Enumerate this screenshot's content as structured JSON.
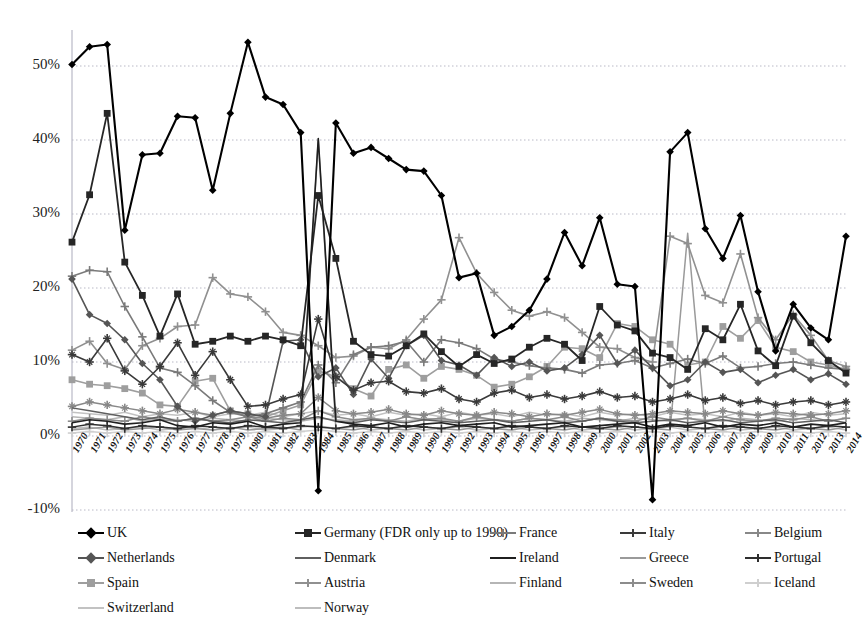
{
  "chart_data": {
    "type": "line",
    "title": "",
    "xlabel": "",
    "ylabel": "",
    "ylim": [
      -10,
      55
    ],
    "yticks": [
      -10,
      0,
      10,
      20,
      30,
      40,
      50
    ],
    "ytick_labels": [
      "-10%",
      "0%",
      "10%",
      "20%",
      "30%",
      "40%",
      "50%"
    ],
    "grid": true,
    "legend_position": "bottom",
    "x": [
      1970,
      1971,
      1972,
      1973,
      1974,
      1975,
      1976,
      1977,
      1978,
      1979,
      1980,
      1981,
      1982,
      1983,
      1984,
      1985,
      1986,
      1987,
      1988,
      1989,
      1990,
      1991,
      1992,
      1993,
      1994,
      1995,
      1996,
      1997,
      1998,
      1999,
      2000,
      2001,
      2002,
      2003,
      2004,
      2005,
      2006,
      2007,
      2008,
      2009,
      2010,
      2011,
      2012,
      2013,
      2014
    ],
    "xtick_labels": [
      "1970",
      "1971",
      "1972",
      "1973",
      "1974",
      "1975",
      "1976",
      "1977",
      "1978",
      "1979",
      "1980",
      "1981",
      "1982",
      "1983",
      "1984",
      "1985",
      "1986",
      "1987",
      "1988",
      "1989",
      "1990",
      "1991",
      "1992",
      "1993",
      "1994",
      "1995",
      "1996",
      "1997",
      "1998",
      "1999",
      "2000",
      "2001",
      "2002",
      "2003",
      "2004",
      "2005",
      "2006",
      "2007",
      "2008",
      "2009",
      "2010",
      "2011",
      "2012",
      "2013",
      "2014"
    ],
    "series": [
      {
        "name": "UK",
        "color": "#000000",
        "marker": "diamond",
        "width": 2.1,
        "values": [
          50.2,
          52.6,
          52.9,
          27.8,
          38.0,
          38.2,
          43.2,
          43.0,
          33.2,
          43.6,
          53.2,
          45.8,
          44.8,
          41.0,
          -7.4,
          42.3,
          38.2,
          39.0,
          37.5,
          36.0,
          35.8,
          32.5,
          21.4,
          22.0,
          13.6,
          14.8,
          17.0,
          21.2,
          27.5,
          23.0,
          29.5,
          20.5,
          20.2,
          -8.6,
          38.4,
          41.0,
          28.0,
          24.0,
          29.8,
          19.5,
          11.5,
          17.8,
          14.6,
          13.0,
          27.0
        ]
      },
      {
        "name": "Germany (FDR only up to 1990)",
        "color": "#262626",
        "marker": "square",
        "width": 1.8,
        "values": [
          26.2,
          32.6,
          43.6,
          23.5,
          19.0,
          13.5,
          19.2,
          12.4,
          12.8,
          13.5,
          12.8,
          13.5,
          13.0,
          12.2,
          32.5,
          24.0,
          12.8,
          11.0,
          10.8,
          12.2,
          13.8,
          11.4,
          9.4,
          11.0,
          9.8,
          10.4,
          12.0,
          13.2,
          12.4,
          10.2,
          17.5,
          15.0,
          14.2,
          11.2,
          10.6,
          9.0,
          14.5,
          13.0,
          17.8,
          11.5,
          9.5,
          16.2,
          12.6,
          10.2,
          8.5
        ]
      },
      {
        "name": "France",
        "color": "#7a7a7a",
        "marker": "plus",
        "width": 1.6,
        "values": [
          21.6,
          22.4,
          22.2,
          17.5,
          13.4,
          9.2,
          8.6,
          6.8,
          4.8,
          3.2,
          2.6,
          3.0,
          3.8,
          4.6,
          9.6,
          7.2,
          11.0,
          12.0,
          12.2,
          12.8,
          10.0,
          13.0,
          12.6,
          11.8,
          10.4,
          10.0,
          9.5,
          9.2,
          9.0,
          8.5,
          9.6,
          9.8,
          10.2,
          9.2,
          9.8,
          10.4,
          9.8,
          10.8,
          9.2,
          9.4,
          9.8,
          10.0,
          9.6,
          9.2,
          9.0
        ]
      },
      {
        "name": "Italy",
        "color": "#3a3a3a",
        "marker": "star",
        "width": 1.6,
        "values": [
          11.0,
          10.0,
          13.2,
          8.8,
          7.0,
          9.4,
          12.6,
          8.2,
          11.4,
          7.6,
          4.0,
          4.2,
          5.0,
          5.6,
          15.8,
          8.0,
          6.2,
          7.2,
          7.4,
          6.0,
          5.8,
          6.4,
          5.0,
          4.6,
          5.8,
          6.2,
          5.2,
          5.6,
          5.0,
          5.4,
          6.0,
          5.2,
          5.4,
          4.6,
          5.0,
          5.6,
          4.8,
          5.2,
          4.4,
          4.8,
          4.2,
          4.6,
          4.8,
          4.2,
          4.6
        ]
      },
      {
        "name": "Belgium",
        "color": "#888888",
        "marker": "star",
        "width": 1.5,
        "values": [
          4.0,
          4.6,
          4.2,
          3.8,
          3.4,
          3.0,
          3.6,
          3.2,
          2.8,
          3.4,
          2.6,
          2.4,
          2.8,
          3.0,
          5.2,
          3.4,
          3.0,
          3.2,
          3.6,
          3.0,
          2.8,
          3.4,
          3.0,
          2.8,
          3.2,
          3.0,
          2.6,
          3.0,
          2.8,
          3.2,
          3.6,
          3.0,
          2.8,
          3.0,
          3.4,
          3.2,
          3.0,
          3.4,
          3.0,
          2.8,
          3.2,
          3.0,
          2.8,
          3.0,
          3.4
        ]
      },
      {
        "name": "Netherlands",
        "color": "#555555",
        "marker": "diamond",
        "width": 1.6,
        "values": [
          21.2,
          16.4,
          15.2,
          13.0,
          9.8,
          7.6,
          4.0,
          2.0,
          2.8,
          3.4,
          3.0,
          2.6,
          12.8,
          13.0,
          8.0,
          9.2,
          5.6,
          10.4,
          7.8,
          12.2,
          13.6,
          10.2,
          9.6,
          8.2,
          10.6,
          9.4,
          10.0,
          8.8,
          9.2,
          11.0,
          13.6,
          9.8,
          11.6,
          9.2,
          6.8,
          7.6,
          10.0,
          8.6,
          9.0,
          7.2,
          8.2,
          9.0,
          7.6,
          8.4,
          7.0
        ]
      },
      {
        "name": "Denmark",
        "color": "#5f5f5f",
        "marker": "line",
        "width": 1.5,
        "values": [
          3.8,
          3.4,
          3.0,
          2.6,
          2.2,
          2.6,
          2.0,
          2.4,
          2.0,
          1.8,
          2.2,
          2.0,
          1.8,
          2.2,
          2.6,
          2.0,
          1.8,
          2.2,
          2.0,
          1.8,
          2.2,
          2.0,
          1.8,
          2.0,
          2.2,
          1.8,
          2.0,
          2.2,
          1.8,
          2.0,
          2.4,
          2.0,
          1.8,
          2.0,
          2.2,
          1.8,
          2.0,
          2.2,
          1.8,
          2.0,
          2.2,
          1.8,
          2.0,
          2.2,
          1.8
        ]
      },
      {
        "name": "Ireland",
        "color": "#1f1f1f",
        "marker": "line",
        "width": 1.6,
        "values": [
          1.8,
          2.2,
          2.0,
          1.6,
          1.8,
          2.2,
          1.4,
          1.2,
          1.8,
          1.6,
          2.0,
          1.2,
          1.6,
          1.8,
          40.2,
          2.0,
          1.6,
          1.4,
          1.8,
          1.2,
          1.6,
          1.8,
          1.4,
          1.6,
          1.8,
          1.2,
          1.4,
          1.6,
          1.8,
          1.2,
          1.4,
          1.6,
          1.8,
          1.2,
          1.6,
          1.4,
          1.8,
          1.2,
          1.6,
          1.4,
          1.8,
          1.2,
          1.6,
          1.4,
          1.8
        ]
      },
      {
        "name": "Greece",
        "color": "#9a9a9a",
        "marker": "line",
        "width": 1.5,
        "values": [
          0.8,
          1.0,
          1.2,
          0.8,
          1.0,
          1.2,
          0.8,
          1.0,
          0.8,
          1.2,
          0.8,
          1.0,
          1.2,
          0.8,
          40.0,
          1.0,
          0.8,
          1.2,
          1.0,
          0.8,
          1.2,
          1.0,
          0.8,
          1.2,
          1.0,
          0.8,
          1.2,
          1.0,
          0.8,
          1.2,
          1.0,
          0.8,
          1.2,
          1.0,
          0.8,
          27.4,
          1.0,
          0.8,
          1.2,
          1.0,
          0.8,
          1.2,
          1.0,
          0.8,
          1.2
        ]
      },
      {
        "name": "Portugal",
        "color": "#2e2e2e",
        "marker": "plus",
        "width": 1.5,
        "values": [
          1.2,
          1.6,
          1.4,
          1.0,
          1.4,
          1.2,
          1.0,
          1.4,
          1.2,
          1.0,
          1.4,
          1.2,
          1.0,
          1.4,
          1.2,
          1.0,
          1.4,
          1.2,
          1.0,
          1.4,
          1.2,
          1.0,
          1.4,
          1.2,
          1.0,
          1.4,
          1.2,
          1.0,
          1.4,
          1.2,
          1.0,
          1.4,
          1.2,
          1.0,
          1.4,
          1.2,
          1.0,
          1.4,
          1.2,
          1.0,
          1.4,
          1.2,
          1.0,
          1.4,
          1.2
        ]
      },
      {
        "name": "Spain",
        "color": "#9e9e9e",
        "marker": "square",
        "width": 1.6,
        "values": [
          7.6,
          7.0,
          6.8,
          6.4,
          5.8,
          4.2,
          4.0,
          7.4,
          7.8,
          3.4,
          3.0,
          2.6,
          3.4,
          4.2,
          8.8,
          8.0,
          6.4,
          5.4,
          9.0,
          9.6,
          7.8,
          9.4,
          9.0,
          8.2,
          6.6,
          7.0,
          8.0,
          9.4,
          12.0,
          11.8,
          10.6,
          15.2,
          14.8,
          13.0,
          12.4,
          9.6,
          10.0,
          14.8,
          13.2,
          15.6,
          12.0,
          11.4,
          10.0,
          9.6,
          9.0
        ]
      },
      {
        "name": "Austria",
        "color": "#909090",
        "marker": "plus",
        "width": 1.6,
        "values": [
          11.6,
          12.8,
          9.8,
          9.0,
          12.2,
          13.2,
          14.8,
          15.0,
          21.4,
          19.2,
          18.8,
          16.8,
          14.0,
          13.6,
          12.2,
          10.6,
          10.8,
          12.0,
          11.8,
          13.0,
          15.8,
          18.4,
          26.8,
          22.0,
          19.4,
          17.0,
          16.2,
          16.8,
          16.0,
          14.0,
          12.0,
          11.8,
          10.6,
          10.0,
          27.0,
          26.0,
          19.0,
          18.0,
          24.6,
          16.0,
          13.0,
          16.4,
          13.6,
          10.2,
          9.4
        ]
      },
      {
        "name": "Finland",
        "color": "#b5b5b5",
        "marker": "line",
        "width": 1.5,
        "values": [
          2.6,
          2.4,
          2.2,
          2.6,
          2.0,
          2.4,
          2.2,
          2.0,
          2.4,
          2.2,
          2.0,
          2.4,
          2.2,
          2.0,
          2.4,
          2.2,
          2.0,
          2.4,
          2.2,
          2.0,
          2.4,
          2.2,
          2.0,
          2.4,
          2.2,
          2.0,
          2.4,
          2.2,
          2.0,
          2.4,
          2.2,
          2.0,
          2.4,
          2.2,
          2.0,
          2.4,
          2.2,
          2.0,
          2.4,
          2.2,
          2.0,
          2.4,
          2.2,
          2.0,
          2.4
        ]
      },
      {
        "name": "Sweden",
        "color": "#8c8c8c",
        "marker": "plus",
        "width": 1.5,
        "values": [
          2.0,
          2.4,
          2.2,
          2.0,
          2.6,
          2.2,
          2.0,
          2.4,
          2.0,
          2.2,
          2.6,
          2.0,
          2.4,
          2.2,
          3.4,
          2.6,
          2.2,
          2.4,
          2.0,
          2.6,
          2.2,
          2.4,
          2.0,
          2.6,
          2.2,
          2.0,
          2.4,
          2.2,
          2.6,
          2.0,
          2.4,
          2.2,
          2.0,
          2.6,
          2.2,
          2.4,
          2.0,
          2.6,
          2.2,
          2.0,
          2.4,
          2.2,
          2.6,
          2.0,
          2.4
        ]
      },
      {
        "name": "Iceland",
        "color": "#cfcfcf",
        "marker": "plus",
        "width": 1.5,
        "values": [
          0.4,
          0.6,
          0.4,
          0.6,
          0.4,
          0.6,
          0.4,
          0.6,
          0.4,
          0.6,
          0.4,
          0.6,
          0.4,
          0.6,
          0.8,
          0.6,
          0.4,
          0.6,
          0.4,
          0.6,
          0.4,
          0.6,
          0.4,
          0.6,
          0.4,
          0.6,
          0.4,
          0.6,
          0.4,
          0.6,
          0.4,
          0.6,
          0.4,
          0.6,
          0.4,
          0.6,
          0.4,
          0.6,
          0.4,
          0.6,
          0.4,
          0.6,
          0.4,
          0.6,
          0.4
        ]
      },
      {
        "name": "Switzerland",
        "color": "#c2c2c2",
        "marker": "line",
        "width": 1.5,
        "values": [
          3.2,
          3.0,
          2.8,
          3.2,
          2.6,
          3.0,
          2.8,
          3.2,
          2.6,
          3.0,
          2.8,
          3.2,
          2.6,
          3.0,
          3.4,
          2.8,
          3.0,
          2.6,
          3.2,
          2.8,
          3.0,
          2.6,
          3.2,
          2.8,
          3.0,
          2.6,
          3.2,
          2.8,
          3.0,
          2.6,
          3.2,
          2.8,
          3.0,
          2.6,
          3.2,
          2.8,
          3.0,
          2.6,
          3.2,
          2.8,
          3.0,
          2.6,
          3.2,
          2.8,
          3.0
        ]
      },
      {
        "name": "Norway",
        "color": "#bdbdbd",
        "marker": "line",
        "width": 1.5,
        "values": [
          1.0,
          1.2,
          0.8,
          1.0,
          1.2,
          0.8,
          1.0,
          1.2,
          0.8,
          1.0,
          1.2,
          0.8,
          1.0,
          1.2,
          1.4,
          1.0,
          1.2,
          0.8,
          1.0,
          1.2,
          0.8,
          1.0,
          1.2,
          0.8,
          1.0,
          1.2,
          0.8,
          1.0,
          1.2,
          0.8,
          1.0,
          1.2,
          0.8,
          1.0,
          1.2,
          0.8,
          1.0,
          1.2,
          0.8,
          1.0,
          1.2,
          0.8,
          1.0,
          1.2,
          0.8
        ]
      }
    ],
    "legend": [
      [
        {
          "label": "UK",
          "series": 0
        },
        {
          "label": "Germany (FDR only up to 1990)",
          "series": 1
        },
        {
          "label": "France",
          "series": 2
        },
        {
          "label": "Italy",
          "series": 3
        },
        {
          "label": "Belgium",
          "series": 4
        }
      ],
      [
        {
          "label": "Netherlands",
          "series": 5
        },
        {
          "label": "Denmark",
          "series": 6
        },
        {
          "label": "Ireland",
          "series": 7
        },
        {
          "label": "Greece",
          "series": 8
        },
        {
          "label": "Portugal",
          "series": 9
        }
      ],
      [
        {
          "label": "Spain",
          "series": 10
        },
        {
          "label": "Austria",
          "series": 11
        },
        {
          "label": "Finland",
          "series": 12
        },
        {
          "label": "Sweden",
          "series": 13
        },
        {
          "label": "Iceland",
          "series": 14
        }
      ],
      [
        {
          "label": "Switzerland",
          "series": 15
        },
        {
          "label": "Norway",
          "series": 16
        }
      ]
    ]
  }
}
